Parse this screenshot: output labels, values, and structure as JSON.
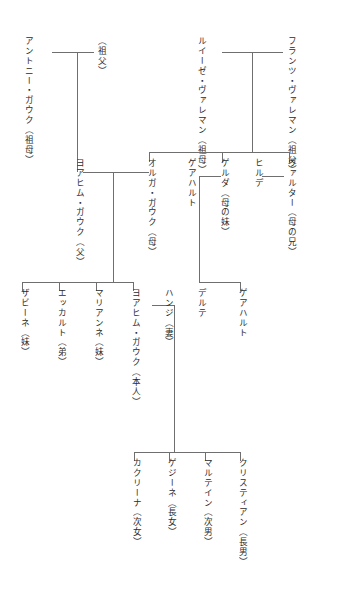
{
  "diagram": {
    "line_color": "#6f6f6f",
    "text_color": "#2b2b2b",
    "background": "#ffffff"
  },
  "people": {
    "paternal_grandfather": "（祖父）",
    "paternal_grandmother": "アントニー・ガウク（祖母）",
    "maternal_grandfather": "フランツ・ヴァレマン（祖父）",
    "maternal_grandmother": "ルイーゼ・ヴァレマン（祖母）",
    "father": "ヨアヒム・ガウク（父）",
    "mother": "オルガ・ガウク（母）",
    "uncle_walter": "ヴァルター（母の兄）",
    "aunt_hilde": "ヒルデ",
    "aunt_gerda": "ゲルダ（母の妹）",
    "gerhart_senior": "ゲアハルト",
    "cousin_dorte": "デルテ",
    "cousin_gerhart": "ゲアハルト",
    "sister_sabine": "ザビーネ（妹）",
    "brother_eckart": "エッカルト（弟）",
    "sister_marianne": "マリアンネ（妹）",
    "self": "ヨアヒム・ガウク（本人）",
    "wife_hansi": "ハンジ（妻）",
    "child_katharina": "カクリーナ（次女）",
    "child_gesine": "ゲジーネ（長女）",
    "child_martin": "マルテイン（次男）",
    "child_christian": "クリスティアン（長男）"
  }
}
